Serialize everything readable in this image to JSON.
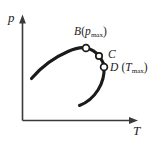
{
  "figure": {
    "kind": "pressure-temperature-diagram",
    "background_color": "#ffffff",
    "ink_color": "#1b1b1b",
    "axis_color": "#3a3a3a"
  },
  "axes": {
    "y": {
      "label": "p",
      "name": "pressure-axis"
    },
    "x": {
      "label": "T",
      "name": "temperature-axis"
    }
  },
  "points": [
    {
      "id": "B",
      "label_main": "B",
      "label_paren_open": "(",
      "label_var": "p",
      "label_sub": "max",
      "label_paren_close": ")",
      "x": 86,
      "y": 48
    },
    {
      "id": "C",
      "label_main": "C",
      "x": 99,
      "y": 56
    },
    {
      "id": "D",
      "label_main": "D",
      "label_paren_open": " (",
      "label_var": "T",
      "label_sub": "max",
      "label_paren_close": ")",
      "x": 104,
      "y": 67
    }
  ],
  "curve": {
    "name": "phase-boundary-curve",
    "path": "M 31.5 78.5 C 40 68.5, 54 57.5, 68 51.5 C 76 48, 82.5 47.2, 86 48 C 91.5 49.2, 96 52, 99 56 C 102 60, 104 63.5, 104 67 C 104.5 74, 103 82, 98 90 C 93 98, 86 103, 79.5 105.5"
  }
}
